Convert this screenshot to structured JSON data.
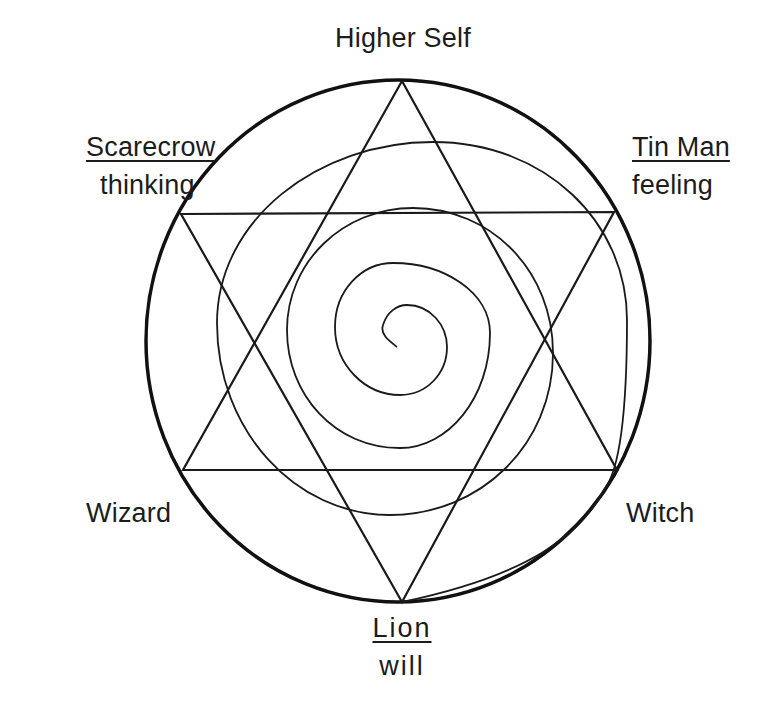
{
  "diagram": {
    "title": "Higher Self",
    "labels": {
      "top": {
        "text": "Higher Self"
      },
      "upper_left": {
        "name": "Scarecrow",
        "quality": "thinking"
      },
      "upper_right": {
        "name": "Tin Man",
        "quality": "feeling"
      },
      "lower_left": {
        "name": "Wizard"
      },
      "lower_right": {
        "name": "Witch"
      },
      "bottom": {
        "name": "Lion",
        "quality": "will"
      }
    },
    "shapes": {
      "outer_circle": {
        "cx": 398,
        "cy": 341,
        "rx": 252,
        "ry": 261,
        "stroke": "#111111"
      },
      "hexagram": {
        "upward_triangle": [
          [
            402,
            81
          ],
          [
            183,
            470
          ],
          [
            617,
            470
          ]
        ],
        "downward_triangle": [
          [
            181,
            214
          ],
          [
            614,
            212
          ],
          [
            402,
            602
          ]
        ],
        "stroke": "#1a1a1a"
      },
      "spiral": {
        "start": [
          397,
          347
        ],
        "end": [
          402,
          602
        ],
        "stroke": "#1a1a1a"
      }
    }
  }
}
